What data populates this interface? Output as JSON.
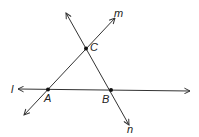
{
  "diagram": {
    "lines": [
      {
        "name": "l",
        "label": "l"
      },
      {
        "name": "m",
        "label": "m"
      },
      {
        "name": "n",
        "label": "n"
      }
    ],
    "points": [
      {
        "name": "A",
        "label": "A"
      },
      {
        "name": "B",
        "label": "B"
      },
      {
        "name": "C",
        "label": "C"
      }
    ],
    "colors": {
      "stroke": "#333333",
      "background": "#ffffff"
    }
  }
}
